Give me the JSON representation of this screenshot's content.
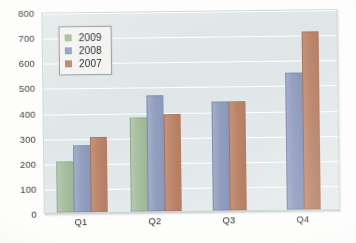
{
  "chart_data": {
    "type": "bar",
    "title": "",
    "xlabel": "",
    "ylabel": "",
    "categories": [
      "Q1",
      "Q2",
      "Q3",
      "Q4"
    ],
    "series": [
      {
        "name": "2009",
        "color": "#a4bf9c",
        "values": [
          205,
          375,
          null,
          null
        ]
      },
      {
        "name": "2008",
        "color": "#939fc3",
        "values": [
          265,
          460,
          435,
          545
        ]
      },
      {
        "name": "2007",
        "color": "#c08568",
        "values": [
          300,
          385,
          435,
          710
        ]
      }
    ],
    "ylim": [
      0,
      800
    ],
    "ytick_step": 100,
    "yticks": [
      "0",
      "100",
      "200",
      "300",
      "400",
      "500",
      "600",
      "700",
      "800"
    ],
    "grid": "horizontal",
    "legend_position": "top-left-inside",
    "plot_background": "#e2e9e9",
    "gridline_color": "#ffffff"
  },
  "legend": {
    "entries": [
      {
        "label": "2009",
        "color": "#a4bf9c"
      },
      {
        "label": "2008",
        "color": "#939fc3"
      },
      {
        "label": "2007",
        "color": "#c08568"
      }
    ]
  }
}
